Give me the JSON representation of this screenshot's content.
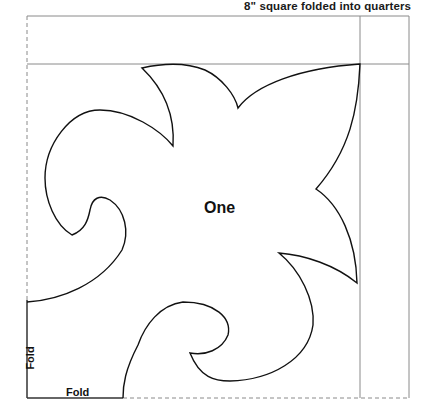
{
  "title": "8\" square folded into quarters",
  "pattern": {
    "piece_label": "One",
    "fold_labels": {
      "left": "Fold",
      "bottom": "Fold"
    },
    "colors": {
      "outline": "#111111",
      "guide": "#8a8a8a",
      "background": "#ffffff"
    }
  }
}
